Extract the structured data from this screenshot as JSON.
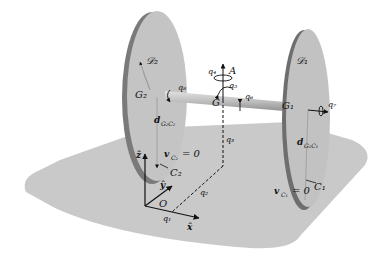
{
  "diagram": {
    "type": "mechanical-system",
    "colors": {
      "floor": "#c9c9c9",
      "disk_face": "#c2c2c2",
      "disk_rim": "#6e6e6e",
      "axle": "#b5b5b5",
      "ink": "#111111"
    },
    "labels": {
      "disk1": "𝒟₁",
      "disk2": "𝒟₂",
      "center1": "G₁",
      "center2": "G₂",
      "center": "G",
      "axis_A": "A",
      "q1": "q₁",
      "q2": "q₂",
      "q3": "q₃",
      "q4": "q₄",
      "q5": "q₅",
      "q6": "q₆",
      "q7": "q₇",
      "q8": "q₈",
      "d1": "d",
      "d1_sub": "G₁C₁",
      "d2": "d",
      "d2_sub": "G₂C₂",
      "contact1": "C₁",
      "contact2": "C₂",
      "v_c1": "v",
      "v_c1_sub": "C₁",
      "v_c1_eq": "= 0",
      "v_c2": "v",
      "v_c2_sub": "C₂",
      "v_c2_eq": "= 0",
      "origin": "O",
      "x_axis": "x̂",
      "y_axis": "ŷ",
      "z_axis": "ẑ"
    }
  }
}
